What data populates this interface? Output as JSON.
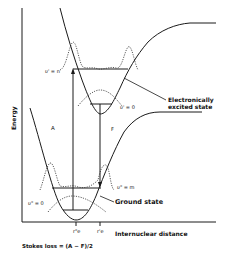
{
  "diagram": {
    "y_axis_label": "Energy",
    "x_axis_label": "Internuclear distance",
    "excited_state_label_line1": "Electronically",
    "excited_state_label_line2": "excited state",
    "ground_state_label": "Ground state",
    "excited_v_n_label": "υ' = n",
    "excited_v_0_label": "υ' = 0",
    "ground_v_m_label": "υ\" = m",
    "ground_v_0_label": "υ\" = 0",
    "absorption_label": "A",
    "fluorescence_label": "F",
    "r_e_ground_label": "r\"e",
    "r_e_excited_label": "r'e",
    "stokes_loss_label": "Stokes loss = (A − F)/2"
  },
  "colors": {
    "line": "#1a1a1a",
    "dotted": "#333333",
    "background": "#ffffff"
  }
}
